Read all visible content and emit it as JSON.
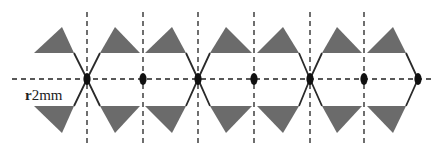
{
  "diagram": {
    "label": {
      "prefix": "r",
      "value": "2mm",
      "x": 25,
      "y": 100
    },
    "colors": {
      "triangle_fill": "#6b6b6b",
      "line": "#2a2a2a",
      "dash": "#222222",
      "node": "#111111",
      "background": "#ffffff"
    },
    "axis": {
      "y": 79,
      "x_start": 12,
      "x_end": 433
    },
    "vertical_guides": {
      "x": [
        87,
        143,
        198,
        254,
        310,
        364
      ],
      "y_start": 12,
      "y_end": 147
    },
    "nodes": [
      {
        "x": 87,
        "type": "crossing"
      },
      {
        "x": 143,
        "type": "plain"
      },
      {
        "x": 198,
        "type": "crossing"
      },
      {
        "x": 254,
        "type": "plain"
      },
      {
        "x": 310,
        "type": "crossing"
      },
      {
        "x": 364,
        "type": "plain"
      },
      {
        "x": 418,
        "type": "end"
      }
    ],
    "top_triangles": [
      {
        "left": 34,
        "right": 74,
        "apex": 62
      },
      {
        "left": 100,
        "right": 140,
        "apex": 115
      },
      {
        "left": 145,
        "right": 186,
        "apex": 172
      },
      {
        "left": 210,
        "right": 252,
        "apex": 226
      },
      {
        "left": 257,
        "right": 299,
        "apex": 283
      },
      {
        "left": 322,
        "right": 362,
        "apex": 337
      },
      {
        "left": 367,
        "right": 406,
        "apex": 393
      }
    ],
    "bottom_triangles": [
      {
        "left": 34,
        "right": 74,
        "apex": 62
      },
      {
        "left": 100,
        "right": 140,
        "apex": 115
      },
      {
        "left": 145,
        "right": 186,
        "apex": 172
      },
      {
        "left": 210,
        "right": 252,
        "apex": 226
      },
      {
        "left": 257,
        "right": 299,
        "apex": 283
      },
      {
        "left": 322,
        "right": 362,
        "apex": 337
      },
      {
        "left": 367,
        "right": 406,
        "apex": 393
      }
    ],
    "geometry": {
      "top_base_y": 53,
      "top_apex_y": 27,
      "bottom_base_y": 106,
      "bottom_apex_y": 133
    },
    "links": [
      {
        "from_top_x": 74,
        "to_bottom_x": 100,
        "via_x": 87
      },
      {
        "from_top_x": 100,
        "to_bottom_x": 74,
        "via_x": 87
      },
      {
        "from_top_x": 186,
        "to_bottom_x": 210,
        "via_x": 198
      },
      {
        "from_top_x": 210,
        "to_bottom_x": 186,
        "via_x": 198
      },
      {
        "from_top_x": 299,
        "to_bottom_x": 322,
        "via_x": 310
      },
      {
        "from_top_x": 322,
        "to_bottom_x": 299,
        "via_x": 310
      },
      {
        "from_top_x": 406,
        "to_bottom_x": 406,
        "via_x": 418
      }
    ]
  }
}
